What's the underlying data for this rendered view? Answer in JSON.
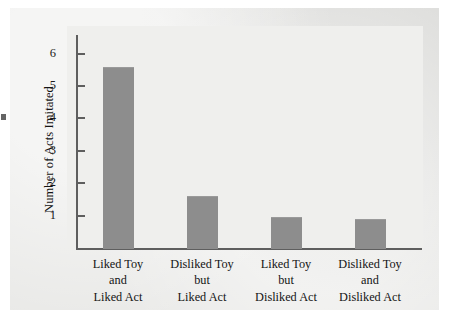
{
  "chart_data": {
    "type": "bar",
    "title": "",
    "subtitle": "",
    "xlabel": "",
    "ylabel": "Number of Acts Imitated",
    "ylim": [
      0,
      6.6
    ],
    "yticks": [
      "1",
      "2",
      "3",
      "4",
      "5",
      "6"
    ],
    "grid": false,
    "legend": "none",
    "categories": [
      "Liked Toy and Liked Act",
      "Disliked Toy but Liked Act",
      "Liked Toy but Disliked Act",
      "Disliked Toy and Disliked Act"
    ],
    "category_lines": [
      [
        "Liked Toy",
        "and",
        "Liked Act"
      ],
      [
        "Disliked Toy",
        "but",
        "Liked Act"
      ],
      [
        "Liked Toy",
        "but",
        "Disliked Act"
      ],
      [
        "Disliked Toy",
        "and",
        "Disliked Act"
      ]
    ],
    "values": [
      5.6,
      1.6,
      0.95,
      0.9
    ],
    "bar_color": "#8d8d8d",
    "axis_color": "#5e5e5e",
    "panel_color": "#e9e9e7",
    "plot_color": "#efefed",
    "text_color": "#141414"
  }
}
